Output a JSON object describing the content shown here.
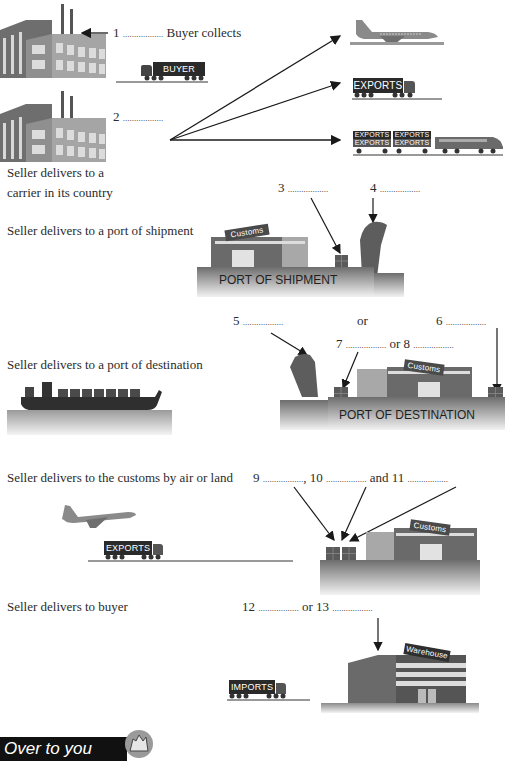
{
  "sections": {
    "buyer_collects": {
      "number": "1",
      "blank": "..................",
      "text": "Buyer collects",
      "truck_label": "BUYER"
    },
    "carrier": {
      "number": "2",
      "blank": "..................",
      "caption_line1": "Seller delivers to a",
      "caption_line2": "carrier in its country",
      "truck_label": "EXPORTS",
      "train_labels": [
        "EXPORTS",
        "EXPORTS",
        "EXPORTS",
        "EXPORTS"
      ]
    },
    "port_of_shipment": {
      "caption": "Seller delivers to a port of shipment",
      "blank3_number": "3",
      "blank3": "..................",
      "blank4_number": "4",
      "blank4": "..................",
      "customs_sign": "Customs",
      "port_label": "PORT OF SHIPMENT"
    },
    "port_of_destination": {
      "caption": "Seller delivers to a port of destination",
      "blank5_number": "5",
      "blank5": "..................",
      "or1": "or",
      "blank6_number": "6",
      "blank6": "..................",
      "blank7_number": "7",
      "blank7": "..................",
      "or2": "or",
      "blank8_number": "8",
      "blank8": "..................",
      "customs_sign": "Customs",
      "port_label": "PORT OF DESTINATION"
    },
    "customs_air_land": {
      "caption": "Seller delivers to the customs by air or land",
      "blank9_number": "9",
      "blank9": "..................",
      "comma": ",",
      "blank10_number": "10",
      "blank10": "..................",
      "and": "and",
      "blank11_number": "11",
      "blank11": "..................",
      "truck_label": "EXPORTS",
      "customs_sign": "Customs"
    },
    "deliver_to_buyer": {
      "caption": "Seller delivers to buyer",
      "blank12_number": "12",
      "blank12": "..................",
      "or": "or",
      "blank13_number": "13",
      "blank13": "..................",
      "truck_label": "IMPORTS",
      "warehouse_sign": "Warehouse"
    }
  },
  "footer": {
    "banner_text": "Over to you",
    "icon": "hand-icon"
  },
  "colors": {
    "text": "#2b2b2b",
    "building_dark": "#5a5a5a",
    "building_light": "#a8a8a8",
    "label_bg": "#2a2a2a",
    "ground": "#9a9a9a"
  }
}
